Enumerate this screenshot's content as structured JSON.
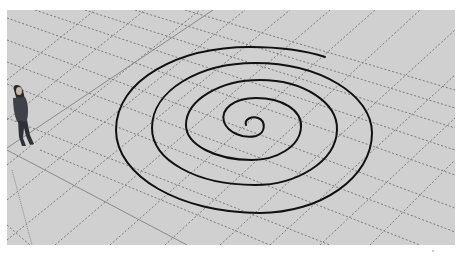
{
  "app": {
    "view": "3d-modeling-viewport",
    "colors": {
      "page_background": "#ffffff",
      "ground_plane": "#d0d0d0",
      "grid_dash": "#7a7a7a",
      "axis_line": "#8a8a8a",
      "spiral_stroke": "#111111",
      "figure_body": "#3e4146",
      "figure_hair": "#2a2a2a"
    }
  },
  "scene": {
    "ground_plane": {
      "label": ""
    },
    "scale_figure": {
      "label": ""
    },
    "spiral": {
      "label": "",
      "turns": 4
    }
  }
}
